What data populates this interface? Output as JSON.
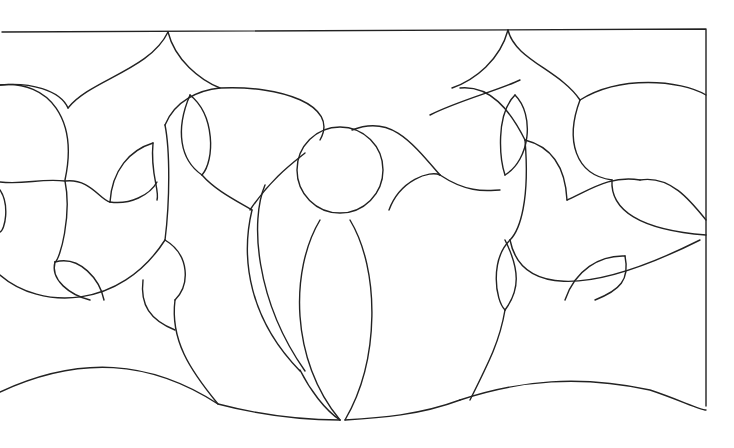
{
  "drawing": {
    "title": "Stained glass line pattern",
    "stroke_color": "#222222",
    "background": "#ffffff",
    "paths": [
      "M2,32 L706,29 L706,406",
      "M0,85 C30,82 60,90 68,108",
      "M68,108 C90,80 150,70 168,32",
      "M168,32 C175,60 200,80 220,88",
      "M0,85 C50,80 78,120 65,180",
      "M0,182 C25,185 40,178 65,181 C90,178 100,200 110,202",
      "M65,181 C72,215 60,260 55,262",
      "M0,190 C10,205 5,230 0,232",
      "M0,275 C40,310 120,310 165,240",
      "M165,240 C170,200 170,150 165,125",
      "M165,125 C175,100 200,90 220,88 C280,85 340,105 320,140",
      "M110,202 C112,170 130,150 153,143",
      "M153,143 C150,175 160,190 157,200",
      "M110,202 C130,205 150,195 157,182",
      "M190,95 C175,130 180,160 202,175",
      "M190,95 C215,115 215,160 202,175",
      "M202,175 C215,190 235,200 252,210",
      "M250,210 C270,180 290,165 305,153",
      "M55,262 C50,280 70,295 90,300",
      "M55,262 C80,255 100,280 104,300",
      "M165,240 C190,255 190,285 175,300",
      "M143,280 C140,305 150,320 175,330",
      "M175,300 C170,340 190,370 218,404",
      "M0,392 C80,355 150,360 218,404 C260,415 300,420 340,420",
      "M252,210 C240,260 250,320 300,371",
      "M265,185 C250,220 255,300 305,371",
      "M300,370 C310,390 325,410 340,420",
      "M320,220 C290,270 290,360 340,420",
      "M350,220 C380,270 380,360 345,420",
      "M345,420 C380,418 420,415 460,400",
      "M460,400 C520,380 580,375 650,390 C680,400 700,410 706,410",
      "M389,210 C400,180 430,170 440,175",
      "M440,175 C410,140 390,115 352,130",
      "M440,175 C470,195 490,190 500,190",
      "M520,80 C500,90 460,100 430,115",
      "M508,30 C500,60 475,80 452,88",
      "M508,30 C515,60 560,70 580,100",
      "M460,88 C490,85 510,110 525,140",
      "M515,95 C495,115 500,160 505,175",
      "M515,95 C535,115 530,160 505,175",
      "M525,140 C530,200 520,230 510,240",
      "M525,140 C545,145 565,160 567,200",
      "M567,200 C590,190 610,175 640,180",
      "M640,180 C670,175 690,200 706,220",
      "M580,100 C620,75 680,80 706,95",
      "M580,100 C565,140 575,175 612,180",
      "M612,180 C610,210 640,230 706,235",
      "M510,240 C520,290 580,300 700,240",
      "M565,300 C575,270 600,255 625,256",
      "M625,256 C630,280 620,290 595,300",
      "M510,240 C490,260 495,300 505,310",
      "M505,310 C520,290 520,270 505,240",
      "M505,310 C500,340 490,360 470,400"
    ],
    "circles": [
      {
        "cx": 340,
        "cy": 170,
        "r": 43
      }
    ]
  }
}
